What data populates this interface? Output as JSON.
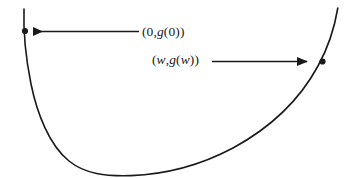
{
  "figure": {
    "width": 351,
    "height": 178,
    "background_color": "#ffffff",
    "stroke_color": "#1a1a1a",
    "curve_stroke_width": 1.6,
    "arrow_stroke_width": 1.6
  },
  "labels": [
    {
      "id": "label-0",
      "text": "(0,g(0))",
      "parts": {
        "open": "(0,",
        "variable": "g",
        "close": "(0))"
      },
      "x": 142,
      "y": 24
    },
    {
      "id": "label-w",
      "text": "(w,g(w))",
      "parts": {
        "open": "(",
        "variable1": "w",
        "comma": ",",
        "variable2": "g",
        "variable3": "w",
        "close": "))"
      },
      "x": 152,
      "y": 52
    }
  ],
  "points": [
    {
      "name": "left-endpoint-dot",
      "label_ref": "(0,g(0))",
      "x": 25,
      "y": 31,
      "radius": 3.1
    },
    {
      "name": "right-endpoint-dot",
      "label_ref": "(w,g(w))",
      "x": 323,
      "y": 61,
      "radius": 3.1
    }
  ],
  "arrows": [
    {
      "name": "arrow-to-left-point",
      "direction": "left",
      "tail_x": 139,
      "tail_y": 31,
      "head_x": 31,
      "head_y": 31,
      "points_at": "(0,g(0))"
    },
    {
      "name": "arrow-to-right-point",
      "direction": "right",
      "tail_x": 212,
      "tail_y": 61,
      "head_x": 318,
      "head_y": 61,
      "points_at": "(w,g(w))"
    }
  ],
  "chart_data": {
    "type": "line",
    "title": "",
    "xlabel": "",
    "ylabel": "",
    "grid": false,
    "legend": "none",
    "xlim": [
      0,
      351
    ],
    "ylim": [
      178,
      0
    ],
    "curve_path": "M 24 10 C 24 30, 27 62, 40 97 C 54 135, 80 166, 124 174 C 170 180, 230 152, 280 112 C 312 86, 330 42, 338 8",
    "annotated_points": [
      {
        "x": 0,
        "y": "g(0)",
        "pixel": [
          25,
          31
        ],
        "label": "(0,g(0))"
      },
      {
        "x": "w",
        "y": "g(w)",
        "pixel": [
          323,
          61
        ],
        "label": "(w,g(w))"
      }
    ]
  }
}
